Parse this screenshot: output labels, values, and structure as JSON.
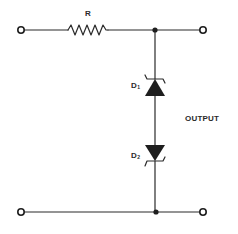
{
  "diagram": {
    "type": "zener-diode voltage regulator / clipper circuit",
    "colors": {
      "line": "#2a2a2a",
      "background": "#ffffff"
    },
    "labels": {
      "resistor": "R",
      "d1": "D",
      "d1_sub": "1",
      "d2": "D",
      "d2_sub": "2",
      "output": "OUTPUT"
    },
    "components": [
      {
        "id": "R",
        "kind": "resistor"
      },
      {
        "id": "D1",
        "kind": "zener-diode",
        "orientation": "cathode-up"
      },
      {
        "id": "D2",
        "kind": "zener-diode",
        "orientation": "cathode-down"
      }
    ],
    "terminals": [
      "input-top",
      "input-bottom",
      "output-top",
      "output-bottom"
    ]
  }
}
